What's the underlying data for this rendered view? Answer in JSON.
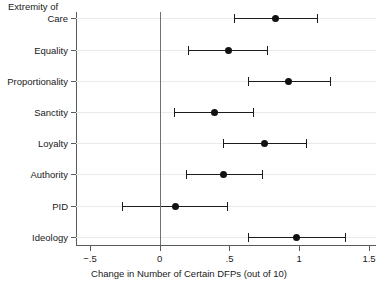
{
  "chart_data": {
    "type": "scatter",
    "title": "",
    "group_header": "Extremity of",
    "xlabel": "Change in Number of Certain DFPs (out of 10)",
    "ylabel": "",
    "xlim": [
      -0.6,
      1.55
    ],
    "xticks": [
      -0.5,
      0,
      0.5,
      1,
      1.5
    ],
    "xtick_labels": [
      "−.5",
      "0",
      ".5",
      "1",
      "1.5"
    ],
    "grid": true,
    "legend": "none",
    "reference_line": 0,
    "categories": [
      "Care",
      "Equality",
      "Proportionality",
      "Sanctity",
      "Loyalty",
      "Authority",
      "PID",
      "Ideology"
    ],
    "points": [
      {
        "label": "Care",
        "estimate": 0.83,
        "low": 0.53,
        "high": 1.13
      },
      {
        "label": "Equality",
        "estimate": 0.49,
        "low": 0.2,
        "high": 0.77
      },
      {
        "label": "Proportionality",
        "estimate": 0.92,
        "low": 0.63,
        "high": 1.22
      },
      {
        "label": "Sanctity",
        "estimate": 0.39,
        "low": 0.1,
        "high": 0.67
      },
      {
        "label": "Loyalty",
        "estimate": 0.75,
        "low": 0.45,
        "high": 1.05
      },
      {
        "label": "Authority",
        "estimate": 0.46,
        "low": 0.19,
        "high": 0.73
      },
      {
        "label": "PID",
        "estimate": 0.11,
        "low": -0.27,
        "high": 0.48
      },
      {
        "label": "Ideology",
        "estimate": 0.98,
        "low": 0.63,
        "high": 1.33
      }
    ]
  }
}
